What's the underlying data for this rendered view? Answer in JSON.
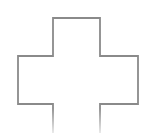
{
  "shape": {
    "name": "plus-cross-outline",
    "points": "53,133 53,104 18,104 18,56 53,56 53,18 100,18 100,56 138,56 138,104 100,104 100,133",
    "stroke_width": "1.8"
  },
  "colors": {
    "stroke": "#8a8a8a",
    "stroke_fade": "#ffffff",
    "background": "#ffffff"
  }
}
